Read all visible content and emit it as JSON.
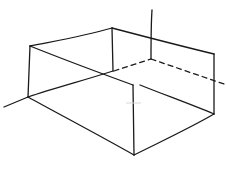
{
  "diagram": {
    "colors": {
      "ink": "#1a1a1a",
      "background": "#ffffff"
    },
    "solid_edges": [
      {
        "name": "top-back-left-edge",
        "points": [
          [
            30,
            46
          ],
          [
            112,
            28
          ]
        ]
      },
      {
        "name": "top-back-right-edge",
        "points": [
          [
            112,
            28
          ],
          [
            214,
            54
          ]
        ]
      },
      {
        "name": "left-front-vertical",
        "points": [
          [
            30,
            46
          ],
          [
            28,
            97
          ]
        ]
      },
      {
        "name": "back-inner-vertical",
        "points": [
          [
            112,
            28
          ],
          [
            113,
            71
          ]
        ]
      },
      {
        "name": "right-vertical",
        "points": [
          [
            214,
            54
          ],
          [
            214,
            114
          ]
        ]
      },
      {
        "name": "diagonal-top-edge",
        "points": [
          [
            30,
            46
          ],
          [
            133,
            85
          ],
          [
            214,
            114
          ]
        ]
      },
      {
        "name": "front-vertical",
        "points": [
          [
            133,
            85
          ],
          [
            134,
            155
          ]
        ]
      },
      {
        "name": "bottom-left-edge",
        "points": [
          [
            28,
            97
          ],
          [
            134,
            155
          ]
        ]
      },
      {
        "name": "bottom-right-edge",
        "points": [
          [
            134,
            155
          ],
          [
            214,
            114
          ]
        ]
      },
      {
        "name": "base-back-edge",
        "points": [
          [
            28,
            97
          ],
          [
            113,
            71
          ]
        ]
      },
      {
        "name": "left-tail",
        "points": [
          [
            4,
            107
          ],
          [
            28,
            97
          ]
        ]
      },
      {
        "name": "axis-vertical-top",
        "points": [
          [
            152,
            10
          ],
          [
            151,
            59
          ]
        ]
      }
    ],
    "dashed_edges": [
      {
        "name": "hidden-left",
        "points": [
          [
            114,
            71
          ],
          [
            151,
            59
          ]
        ]
      },
      {
        "name": "hidden-right",
        "points": [
          [
            151,
            59
          ],
          [
            224,
            84
          ]
        ]
      }
    ]
  }
}
